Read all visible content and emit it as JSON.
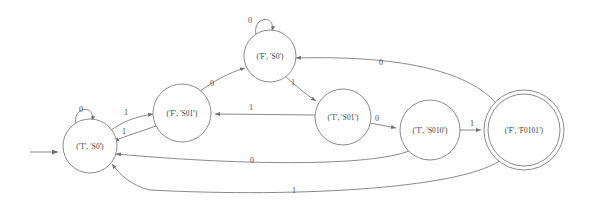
{
  "diagram": {
    "type": "finite-state-machine",
    "title": "",
    "colors": {
      "background": "#ffffff",
      "stroke": "#8a8a8a",
      "text": "#3a3a3a",
      "label": "#4a4a4a"
    },
    "states": [
      {
        "id": "t_s0",
        "label": "('T', 'S0')",
        "cx": 90,
        "cy": 146,
        "r": 27,
        "accepting": false,
        "start": true
      },
      {
        "id": "f_s01",
        "label": "('F', 'S01')",
        "cx": 182,
        "cy": 113,
        "r": 29,
        "accepting": false,
        "start": false
      },
      {
        "id": "f_s0",
        "label": "('F', 'S0')",
        "cx": 270,
        "cy": 56,
        "r": 26,
        "accepting": false,
        "start": false
      },
      {
        "id": "t_s01",
        "label": "('T', 'S01')",
        "cx": 343,
        "cy": 117,
        "r": 28,
        "accepting": false,
        "start": false
      },
      {
        "id": "t_s010",
        "label": "('T', 'S010')",
        "cx": 430,
        "cy": 130,
        "r": 30,
        "accepting": false,
        "start": false
      },
      {
        "id": "f_f0101",
        "label": "('F', 'F0101')",
        "cx": 524,
        "cy": 130,
        "r": 40,
        "accepting": true,
        "start": false
      }
    ],
    "transitions": [
      {
        "from": "t_s0",
        "to": "t_s0",
        "symbol": "0",
        "kind": "self-loop"
      },
      {
        "from": "f_s0",
        "to": "f_s0",
        "symbol": "0",
        "kind": "self-loop"
      },
      {
        "from": "t_s0",
        "to": "f_s01",
        "symbol": "1",
        "kind": "curve"
      },
      {
        "from": "f_s01",
        "to": "t_s0",
        "symbol": "1",
        "kind": "curve"
      },
      {
        "from": "f_s01",
        "to": "f_s0",
        "symbol": "0",
        "kind": "line"
      },
      {
        "from": "f_s0",
        "to": "t_s01",
        "symbol": "1",
        "kind": "line"
      },
      {
        "from": "t_s01",
        "to": "f_s01",
        "symbol": "1",
        "kind": "line"
      },
      {
        "from": "t_s01",
        "to": "t_s010",
        "symbol": "0",
        "kind": "line"
      },
      {
        "from": "t_s010",
        "to": "f_f0101",
        "symbol": "1",
        "kind": "line"
      },
      {
        "from": "f_f0101",
        "to": "f_s0",
        "symbol": "0",
        "kind": "long-curve-top"
      },
      {
        "from": "t_s010",
        "to": "t_s0",
        "symbol": "0",
        "kind": "long-curve-bottom"
      },
      {
        "from": "f_f0101",
        "to": "t_s0",
        "symbol": "1",
        "kind": "long-curve-bottom"
      }
    ],
    "edge_labels": [
      {
        "id": "lbl-t-s0-self",
        "text": "0",
        "x": 81,
        "y": 110
      },
      {
        "id": "lbl-f-s0-self",
        "text": "0",
        "x": 250,
        "y": 21
      },
      {
        "id": "lbl-t-s0-to-f-s01",
        "text": "1",
        "x": 126,
        "y": 113
      },
      {
        "id": "lbl-f-s01-to-t-s0",
        "text": "1",
        "x": 124,
        "y": 132
      },
      {
        "id": "lbl-f-s01-to-f-s0",
        "text": "0",
        "x": 212,
        "y": 84
      },
      {
        "id": "lbl-f-s0-to-t-s01",
        "text": "1",
        "x": 293,
        "y": 83
      },
      {
        "id": "lbl-t-s01-to-f-s01",
        "text": "1",
        "x": 251,
        "y": 108
      },
      {
        "id": "lbl-t-s01-to-t-s010",
        "text": "0",
        "x": 377,
        "y": 119
      },
      {
        "id": "lbl-t-s010-to-f0101",
        "text": "1",
        "x": 472,
        "y": 124
      },
      {
        "id": "lbl-f0101-to-f-s0",
        "text": "0",
        "x": 381,
        "y": 63
      },
      {
        "id": "lbl-t-s010-to-t-s0",
        "text": "0",
        "x": 252,
        "y": 161
      },
      {
        "id": "lbl-f0101-to-t-s0",
        "text": "1",
        "x": 294,
        "y": 191
      }
    ],
    "start_arrow": {
      "id": "start-arrow",
      "x1": 30,
      "y1": 152,
      "x2": 62,
      "y2": 152
    }
  }
}
